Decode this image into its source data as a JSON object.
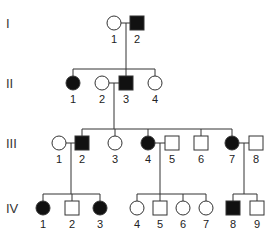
{
  "diagram": {
    "type": "pedigree",
    "generations": [
      {
        "roman": "I",
        "y": 23
      },
      {
        "roman": "II",
        "y": 83
      },
      {
        "roman": "III",
        "y": 143
      },
      {
        "roman": "IV",
        "y": 208
      }
    ],
    "individuals": [
      {
        "id": "I-1",
        "label": "1",
        "sex": "female",
        "affected": false,
        "x": 114,
        "y": 23
      },
      {
        "id": "I-2",
        "label": "2",
        "sex": "male",
        "affected": true,
        "x": 137,
        "y": 23
      },
      {
        "id": "II-1",
        "label": "1",
        "sex": "female",
        "affected": true,
        "x": 73,
        "y": 83
      },
      {
        "id": "II-2",
        "label": "2",
        "sex": "female",
        "affected": false,
        "x": 102,
        "y": 83
      },
      {
        "id": "II-3",
        "label": "3",
        "sex": "male",
        "affected": true,
        "x": 126,
        "y": 83
      },
      {
        "id": "II-4",
        "label": "4",
        "sex": "female",
        "affected": false,
        "x": 155,
        "y": 83
      },
      {
        "id": "III-1",
        "label": "1",
        "sex": "female",
        "affected": false,
        "x": 59,
        "y": 143
      },
      {
        "id": "III-2",
        "label": "2",
        "sex": "male",
        "affected": true,
        "x": 82,
        "y": 143
      },
      {
        "id": "III-3",
        "label": "3",
        "sex": "female",
        "affected": false,
        "x": 115,
        "y": 143
      },
      {
        "id": "III-4",
        "label": "4",
        "sex": "female",
        "affected": true,
        "x": 148,
        "y": 143
      },
      {
        "id": "III-5",
        "label": "5",
        "sex": "male",
        "affected": false,
        "x": 172,
        "y": 143
      },
      {
        "id": "III-6",
        "label": "6",
        "sex": "male",
        "affected": false,
        "x": 201,
        "y": 143
      },
      {
        "id": "III-7",
        "label": "7",
        "sex": "female",
        "affected": true,
        "x": 232,
        "y": 143
      },
      {
        "id": "III-8",
        "label": "8",
        "sex": "male",
        "affected": false,
        "x": 256,
        "y": 143
      },
      {
        "id": "IV-1",
        "label": "1",
        "sex": "female",
        "affected": true,
        "x": 43,
        "y": 208
      },
      {
        "id": "IV-2",
        "label": "2",
        "sex": "male",
        "affected": false,
        "x": 72,
        "y": 208
      },
      {
        "id": "IV-3",
        "label": "3",
        "sex": "female",
        "affected": true,
        "x": 100,
        "y": 208
      },
      {
        "id": "IV-4",
        "label": "4",
        "sex": "female",
        "affected": false,
        "x": 137,
        "y": 208
      },
      {
        "id": "IV-5",
        "label": "5",
        "sex": "male",
        "affected": false,
        "x": 160,
        "y": 208
      },
      {
        "id": "IV-6",
        "label": "6",
        "sex": "female",
        "affected": false,
        "x": 183,
        "y": 208
      },
      {
        "id": "IV-7",
        "label": "7",
        "sex": "female",
        "affected": false,
        "x": 206,
        "y": 208
      },
      {
        "id": "IV-8",
        "label": "8",
        "sex": "male",
        "affected": true,
        "x": 233,
        "y": 208
      },
      {
        "id": "IV-9",
        "label": "9",
        "sex": "male",
        "affected": false,
        "x": 257,
        "y": 208
      }
    ],
    "matings": [
      {
        "partners": [
          "I-1",
          "I-2"
        ],
        "children": [
          "II-1",
          "II-3",
          "II-4"
        ]
      },
      {
        "partners": [
          "II-2",
          "II-3"
        ],
        "children": [
          "III-2",
          "III-3",
          "III-4",
          "III-6",
          "III-7"
        ]
      },
      {
        "partners": [
          "III-1",
          "III-2"
        ],
        "children": [
          "IV-1",
          "IV-2",
          "IV-3"
        ]
      },
      {
        "partners": [
          "III-4",
          "III-5"
        ],
        "children": [
          "IV-4",
          "IV-5",
          "IV-6",
          "IV-7"
        ]
      },
      {
        "partners": [
          "III-7",
          "III-8"
        ],
        "children": [
          "IV-8",
          "IV-9"
        ]
      }
    ],
    "colors": {
      "affected": "#111111",
      "unaffected": "#ffffff",
      "line": "#333333"
    }
  }
}
